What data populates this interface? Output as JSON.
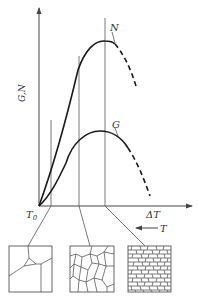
{
  "figure": {
    "y_axis_label": "G,N",
    "x_axis_label": "ΔT",
    "origin_label": "T",
    "origin_subscript": "0",
    "temperature_arrow_label": "T",
    "curve_N_label": "N",
    "curve_G_label": "G"
  },
  "microstructures": [
    {
      "name": "coarse-grains",
      "grain_size": "coarse"
    },
    {
      "name": "medium-grains",
      "grain_size": "medium"
    },
    {
      "name": "fine-grains",
      "grain_size": "fine"
    }
  ],
  "colors": {
    "line": "#1a1a1a",
    "axis": "#444444",
    "background": "#ffffff"
  }
}
